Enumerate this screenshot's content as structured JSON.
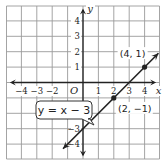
{
  "chart_data": {
    "type": "line",
    "title": "",
    "xlabel": "x",
    "ylabel": "y",
    "xlim": [
      -5,
      5
    ],
    "ylim": [
      -5,
      5
    ],
    "grid": true,
    "x_ticks": [
      "−4",
      "−3",
      "−2",
      "1",
      "2",
      "3",
      "4"
    ],
    "x_tick_values": [
      -4,
      -3,
      -2,
      1,
      2,
      3,
      4
    ],
    "y_ticks": [
      "4",
      "3",
      "2",
      "1",
      "−3",
      "−4"
    ],
    "y_tick_values": [
      4,
      3,
      2,
      1,
      -3,
      -4
    ],
    "origin_label": "O",
    "series": [
      {
        "name": "y = x − 3",
        "slope": 1,
        "intercept": -3,
        "x": [
          -1.3,
          4.9
        ],
        "y": [
          -4.3,
          1.9
        ]
      }
    ],
    "points": [
      {
        "x": 4,
        "y": 1,
        "label": "(4, 1)"
      },
      {
        "x": 2,
        "y": -1,
        "label": "(2, −1)"
      }
    ],
    "annotations": [
      {
        "text": "y = x − 3",
        "type": "callout"
      }
    ]
  },
  "colors": {
    "grid": "#9a9a9a",
    "axis": "#222222",
    "line": "#222222"
  }
}
